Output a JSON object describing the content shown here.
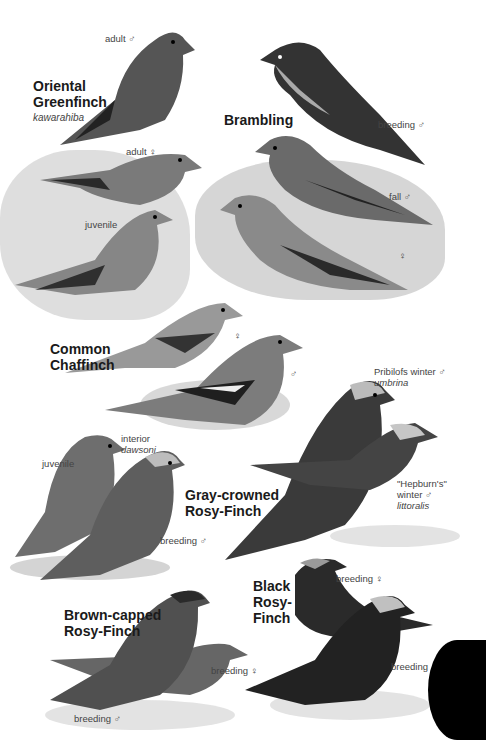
{
  "page": {
    "side_tab_color": "#000000",
    "sections": [
      {
        "id": "oriental-greenfinch",
        "species": "Oriental\nGreenfinch",
        "species_line1": "Oriental",
        "species_line2": "Greenfinch",
        "scientific": "kawarahiba",
        "labels": [
          {
            "text": "adult",
            "sex": "♂"
          },
          {
            "text": "adult",
            "sex": "♀"
          },
          {
            "text": "juvenile",
            "sex": ""
          }
        ]
      },
      {
        "id": "brambling",
        "species_line1": "Brambling",
        "labels": [
          {
            "text": "breeding",
            "sex": "♂"
          },
          {
            "text": "fall",
            "sex": "♂"
          },
          {
            "text": "",
            "sex": "♀"
          }
        ]
      },
      {
        "id": "common-chaffinch",
        "species_line1": "Common",
        "species_line2": "Chaffinch",
        "labels": [
          {
            "text": "",
            "sex": "♀"
          },
          {
            "text": "",
            "sex": "♂"
          }
        ]
      },
      {
        "id": "gray-crowned-rosy-finch",
        "species_line1": "Gray-crowned",
        "species_line2": "Rosy-Finch",
        "labels": [
          {
            "text": "Pribilofs winter",
            "sex": "♂",
            "subspecies": "umbrina"
          },
          {
            "text": "\"Hepburn's\"",
            "text2": "winter",
            "sex": "♂",
            "subspecies": "littoralis"
          },
          {
            "text": "juvenile",
            "sex": ""
          },
          {
            "text": "interior",
            "sex": "",
            "subspecies": "dawsoni"
          },
          {
            "text": "breeding",
            "sex": "♂"
          }
        ]
      },
      {
        "id": "black-rosy-finch",
        "species_line1": "Black",
        "species_line2": "Rosy-",
        "species_line3": "Finch",
        "labels": [
          {
            "text": "breeding",
            "sex": "♀"
          },
          {
            "text": "breeding",
            "sex": "♂"
          }
        ]
      },
      {
        "id": "brown-capped-rosy-finch",
        "species_line1": "Brown-capped",
        "species_line2": "Rosy-Finch",
        "labels": [
          {
            "text": "breeding",
            "sex": "♀"
          },
          {
            "text": "breeding",
            "sex": "♂"
          }
        ]
      }
    ]
  }
}
